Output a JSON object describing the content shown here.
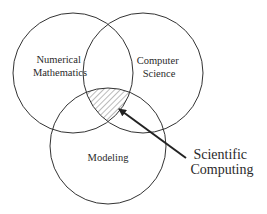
{
  "diagram": {
    "type": "venn",
    "sets": [
      {
        "id": "numerical-mathematics",
        "lines": [
          "Numerical",
          "Mathematics"
        ]
      },
      {
        "id": "computer-science",
        "lines": [
          "Computer",
          "Science"
        ]
      },
      {
        "id": "modeling",
        "lines": [
          "Modeling"
        ]
      }
    ],
    "intersection_label": {
      "lines": [
        "Scientific",
        "Computing"
      ]
    },
    "colors": {
      "stroke": "#333333",
      "hatch": "#555555",
      "text": "#2a2a2a"
    }
  }
}
